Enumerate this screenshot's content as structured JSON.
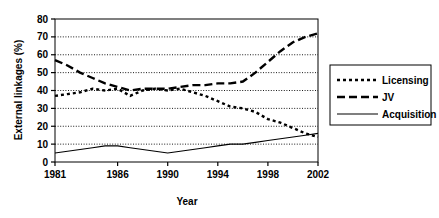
{
  "chart_data": {
    "type": "line",
    "title": "",
    "xlabel": "Year",
    "ylabel": "External linkages (%)",
    "xlim": [
      1981,
      2002
    ],
    "ylim": [
      0,
      80
    ],
    "yticks": [
      0,
      10,
      20,
      30,
      40,
      50,
      60,
      70,
      80
    ],
    "xticks": [
      1981,
      1986,
      1990,
      1994,
      1998,
      2002
    ],
    "xtick_labels": [
      "1981",
      "1986",
      "1990",
      "1994",
      "1998",
      "2002"
    ],
    "ytick_labels": [
      "0",
      "10",
      "20",
      "30",
      "40",
      "50",
      "60",
      "70",
      "80"
    ],
    "grid": "horizontal-dotted",
    "legend_position": "right-outside",
    "x": [
      1981,
      1982,
      1983,
      1984,
      1985,
      1986,
      1987,
      1988,
      1989,
      1990,
      1991,
      1992,
      1993,
      1994,
      1995,
      1996,
      1997,
      1998,
      1999,
      2000,
      2001,
      2002
    ],
    "series": [
      {
        "name": "Licensing",
        "style": "dotted",
        "values": [
          37,
          38,
          39,
          41,
          40,
          41,
          37,
          40,
          41,
          40,
          41,
          39,
          37,
          34,
          31,
          30,
          28,
          24,
          22,
          19,
          16,
          14
        ]
      },
      {
        "name": "JV",
        "style": "dashed",
        "values": [
          57,
          54,
          50,
          47,
          44,
          42,
          40,
          41,
          41,
          41,
          42,
          43,
          43,
          44,
          44,
          45,
          50,
          56,
          62,
          67,
          70,
          72
        ]
      },
      {
        "name": "Acquisition",
        "style": "solid",
        "values": [
          5,
          6,
          7,
          8,
          9,
          9,
          8,
          7,
          6,
          5,
          6,
          7,
          8,
          9,
          10,
          10,
          11,
          12,
          13,
          14,
          15,
          16
        ]
      }
    ]
  },
  "legend": {
    "items": [
      {
        "label": "Licensing",
        "style": "dotted"
      },
      {
        "label": "JV",
        "style": "dashed"
      },
      {
        "label": "Acquisition",
        "style": "solid"
      }
    ]
  }
}
